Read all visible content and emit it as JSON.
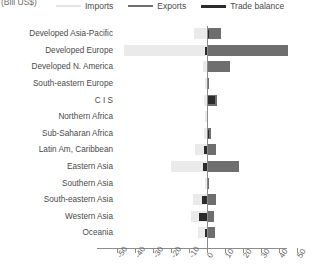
{
  "unit_caption": "(Bill US$)",
  "legend": {
    "items": [
      {
        "label": "Imports",
        "key": "imports",
        "color": "#e2e2e2"
      },
      {
        "label": "Exports",
        "key": "exports",
        "color": "#6e6e6e"
      },
      {
        "label": "Trade balance",
        "key": "balance",
        "color": "#2b2b2b"
      }
    ]
  },
  "axis": {
    "ticks": [
      "-50",
      "-40",
      "-30",
      "-20",
      "-10",
      "0",
      "10",
      "20",
      "30",
      "40",
      "50"
    ],
    "min": -50,
    "max": 50
  },
  "chart_data": {
    "type": "bar",
    "orientation": "horizontal",
    "title": "",
    "subtitle": "",
    "xlabel": "(Bill US$)",
    "ylabel": "",
    "xlim": [
      -50,
      50
    ],
    "grid": false,
    "legend_position": "top",
    "categories": [
      "Developed Asia-Pacific",
      "Developed Europe",
      "Developed N. America",
      "South-eastern Europe",
      "C I S",
      "Northern Africa",
      "Sub-Saharan Africa",
      "Latin Am, Caribbean",
      "Eastern Asia",
      "Southern Asia",
      "South-eastern Asia",
      "Western Asia",
      "Oceania"
    ],
    "series": [
      {
        "name": "Imports",
        "color": "#eaeaea",
        "values": [
          -7.0,
          -46.0,
          -2.0,
          -1.0,
          -1.5,
          -0.8,
          -1.2,
          -6.5,
          -20.0,
          -1.0,
          -7.5,
          -8.5,
          -5.0
        ]
      },
      {
        "name": "Exports",
        "color": "#6e6e6e",
        "values": [
          8.0,
          45.5,
          13.0,
          1.6,
          6.0,
          1.0,
          2.6,
          5.0,
          18.0,
          1.6,
          5.0,
          4.0,
          4.5
        ]
      },
      {
        "name": "Trade balance",
        "color": "#2b2b2b",
        "values": [
          1.2,
          -0.6,
          0.8,
          0.6,
          4.5,
          0.4,
          1.4,
          -1.5,
          -2.0,
          0.7,
          -2.5,
          -4.5,
          -0.5
        ]
      }
    ]
  }
}
